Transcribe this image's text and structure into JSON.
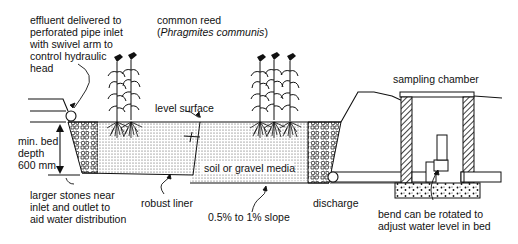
{
  "diagram": {
    "type": "cross-section",
    "labels": {
      "inlet": "effluent delivered to\nperforated pipe inlet\nwith swivel arm to\ncontrol hydraulic\nhead",
      "plant_common": "common reed",
      "plant_latin_open": "(",
      "plant_latin": "Phragmites communis",
      "plant_latin_close": ")",
      "level_surface": "level surface",
      "bed_depth": "min. bed\ndepth\n600 mm",
      "larger_stones": "larger stones near\ninlet and outlet to\naid water distribution",
      "liner": "robust liner",
      "media": "soil or gravel media",
      "slope": "0.5% to 1% slope",
      "discharge": "discharge",
      "sampling_chamber": "sampling chamber",
      "bend": "bend can be rotated to\nadjust water level in bed"
    },
    "colors": {
      "line": "#111111",
      "background": "#ffffff",
      "media_dot": "#555555"
    }
  }
}
